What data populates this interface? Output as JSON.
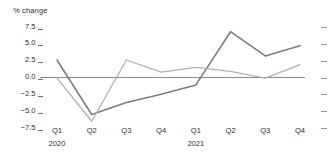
{
  "chart_data": {
    "type": "line",
    "title": "% change",
    "xlabel": "",
    "ylabel": "% change",
    "ylim": [
      -7.5,
      7.5
    ],
    "yticks": [
      "7.5",
      "5.0",
      "2.5",
      "0.0",
      "-2.5",
      "-5.0",
      "-7.5"
    ],
    "grid": false,
    "legend": "none",
    "zero_baseline": true,
    "categories": [
      "Q1",
      "Q2",
      "Q3",
      "Q4",
      "Q1",
      "Q2",
      "Q3",
      "Q4"
    ],
    "year_labels": [
      {
        "label": "2020",
        "at_category_index": 0
      },
      {
        "label": "2021",
        "at_category_index": 4
      }
    ],
    "series": [
      {
        "name": "series-1",
        "color": "#7d7d7d",
        "width": 1.6,
        "values": [
          2.6,
          -5.5,
          -3.7,
          -2.5,
          -1.1,
          6.8,
          3.2,
          4.7
        ]
      },
      {
        "name": "series-2",
        "color": "#b0b0b0",
        "width": 1.3,
        "values": [
          -0.1,
          -6.5,
          2.6,
          0.8,
          1.5,
          0.9,
          -0.1,
          1.9
        ]
      }
    ]
  },
  "axes": {
    "title_text": "% change",
    "right_tick_count": 7
  }
}
